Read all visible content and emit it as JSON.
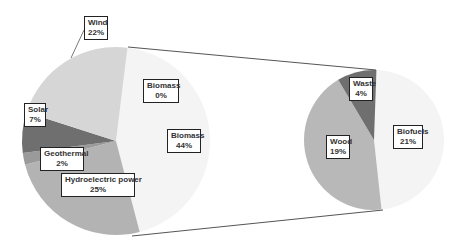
{
  "chart_data": {
    "type": "bar-of-pie",
    "title": "",
    "primary_pie": {
      "slices": [
        {
          "label": "Biomass",
          "value": 44,
          "display": "44%",
          "color": "#f4f4f4"
        },
        {
          "label": "Hydroelectric power",
          "value": 25,
          "display": "25%",
          "color": "#b3b3b3"
        },
        {
          "label": "Geothermal",
          "value": 2,
          "display": "2%",
          "color": "#9a9a9a"
        },
        {
          "label": "Solar",
          "value": 7,
          "display": "7%",
          "color": "#6f6f6f"
        },
        {
          "label": "Wind",
          "value": 22,
          "display": "22%",
          "color": "#d6d6d6"
        }
      ],
      "extra_label": {
        "label": "Biomass",
        "display": "0%"
      }
    },
    "secondary_pie": {
      "slices": [
        {
          "label": "Biofuels",
          "value": 21,
          "display": "21%",
          "color": "#f4f4f4"
        },
        {
          "label": "Wood",
          "value": 19,
          "display": "19%",
          "color": "#b8b8b8"
        },
        {
          "label": "Waste",
          "value": 4,
          "display": "4%",
          "color": "#6f6f6f"
        }
      ]
    },
    "legend": "none",
    "grid": false
  },
  "labels": {
    "wind": {
      "name": "Wind",
      "pct": "22%"
    },
    "biomass0": {
      "name": "Biomass",
      "pct": "0%"
    },
    "solar": {
      "name": "Solar",
      "pct": "7%"
    },
    "biomass44": {
      "name": "Biomass",
      "pct": "44%"
    },
    "geothermal": {
      "name": "Geothermal",
      "pct": "2%"
    },
    "hydro": {
      "name": "Hydroelectric power",
      "pct": "25%"
    },
    "waste": {
      "name": "Waste",
      "pct": "4%"
    },
    "wood": {
      "name": "Wood",
      "pct": "19%"
    },
    "biofuels": {
      "name": "Biofuels",
      "pct": "21%"
    }
  }
}
